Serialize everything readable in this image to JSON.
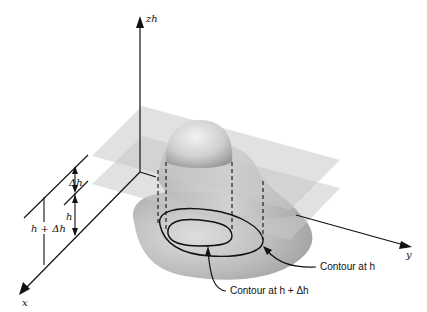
{
  "figure": {
    "axes": {
      "z_label": "zh",
      "x_label": "x",
      "y_label": "y"
    },
    "dimension_labels": {
      "delta_h": "Δh",
      "h": "h",
      "h_plus_delta_h": "h + Δh"
    },
    "annotations": {
      "contour_h": "Contour at h",
      "contour_h_plus_delta_h": "Contour at h + Δh"
    },
    "colors": {
      "plane": "#c8c8c8",
      "surface_base": "#a9a9a9",
      "surface_light": "#d9d9d9",
      "line": "#111111"
    }
  }
}
